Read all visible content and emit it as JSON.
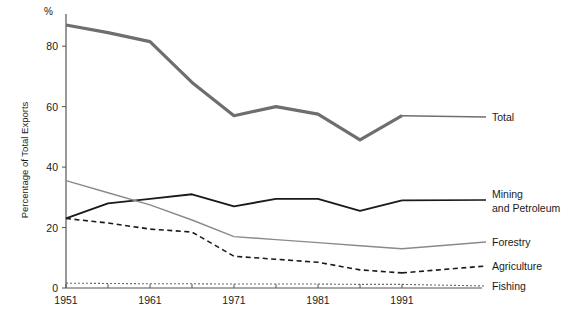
{
  "chart_data": {
    "type": "line",
    "title": "",
    "subtitle": "",
    "xlabel": "",
    "ylabel": "Percentage of Total Exports",
    "y_unit_mark": "%",
    "xlim": [
      1951,
      1991
    ],
    "ylim": [
      0,
      88
    ],
    "yticks": [
      0,
      20,
      40,
      60,
      80
    ],
    "ytick_labels": [
      "0",
      "20",
      "40",
      "60",
      "80"
    ],
    "xticks": [
      1951,
      1956,
      1961,
      1966,
      1971,
      1976,
      1981,
      1986,
      1991
    ],
    "xtick_labels": [
      "1951",
      "",
      "1961",
      "",
      "1971",
      "",
      "1981",
      "",
      "1991"
    ],
    "x_labeled_ticks": [
      "1951",
      "1961",
      "1971",
      "1981",
      "1991"
    ],
    "grid": false,
    "legend_position": "right-inline",
    "x": [
      1951,
      1956,
      1961,
      1966,
      1971,
      1976,
      1981,
      1986,
      1991
    ],
    "series": [
      {
        "name": "Total",
        "label": "Total",
        "color": "#6e6e6e",
        "style": "solid",
        "width": 3.2,
        "values": [
          87,
          84.5,
          81.5,
          68,
          57,
          60,
          57.5,
          49,
          57
        ]
      },
      {
        "name": "Mining and Petroleum",
        "label": "Mining\nand Petroleum",
        "label_line1": "Mining",
        "label_line2": "and Petroleum",
        "color": "#1a1a1a",
        "style": "solid",
        "width": 1.9,
        "values": [
          23,
          28,
          29.5,
          31,
          27,
          29.5,
          29.5,
          25.5,
          29
        ]
      },
      {
        "name": "Forestry",
        "label": "Forestry",
        "color": "#8a8a8a",
        "style": "solid",
        "width": 1.4,
        "values": [
          35.5,
          31.5,
          27.5,
          22.5,
          17,
          16,
          15,
          14,
          13
        ]
      },
      {
        "name": "Agriculture",
        "label": "Agriculture",
        "color": "#1a1a1a",
        "style": "dashed",
        "width": 1.6,
        "values": [
          23,
          21.5,
          19.5,
          18.5,
          10.5,
          9.5,
          8.5,
          6,
          5
        ]
      },
      {
        "name": "Fishing",
        "label": "Fishing",
        "color": "#6a6a6a",
        "style": "dotted",
        "width": 1.1,
        "values": [
          1.6,
          1.5,
          1.4,
          1.4,
          1.3,
          1.3,
          1.3,
          1.2,
          1.2
        ]
      }
    ]
  }
}
